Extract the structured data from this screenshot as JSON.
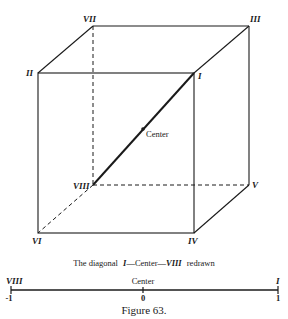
{
  "figure": {
    "caption": "Figure 63.",
    "subtitle_parts": {
      "prefix": "The diagonal",
      "v1": "I",
      "dash1": "—Center—",
      "v2": "VIII",
      "suffix": "redrawn"
    }
  },
  "cube": {
    "vertices": {
      "I": "I",
      "II": "II",
      "III": "III",
      "IV": "IV",
      "V": "V",
      "VI": "VI",
      "VII": "VII",
      "VIII": "VIII"
    },
    "center_label": "Center",
    "line_color": "#1a1a1a"
  },
  "axis": {
    "left_vertex": "VIII",
    "right_vertex": "I",
    "center_label": "Center",
    "ticks": [
      "-1",
      "0",
      "1"
    ]
  }
}
